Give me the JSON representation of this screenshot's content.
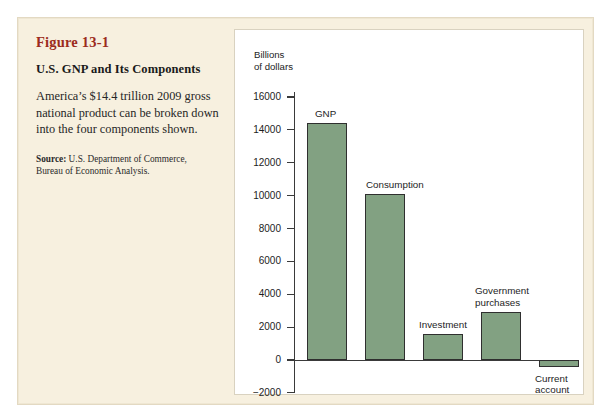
{
  "caption": {
    "figure_number": "Figure 13-1",
    "title": "U.S. GNP and Its Components",
    "description": "America’s $14.4 trillion 2009 gross national product can be broken down into the four components shown.",
    "source_label": "Source:",
    "source_text": " U.S. Department of Commerce, Bureau of Economic Analysis."
  },
  "colors": {
    "bar_fill": "#82a182",
    "bar_stroke": "#2f2f2f",
    "panel_background": "#f7f0df",
    "chart_background": "#ffffff",
    "figure_number_color": "#9c2b20",
    "axis_color": "#3a3a3a"
  },
  "chart_data": {
    "type": "bar",
    "title": "U.S. GNP and Its Components",
    "xlabel": "",
    "ylabel": "Billions\nof dollars",
    "categories": [
      "GNP",
      "Consumption",
      "Investment",
      "Government purchases",
      "Current account"
    ],
    "values": [
      14400,
      10100,
      1600,
      2900,
      -400
    ],
    "ylim": [
      -2000,
      16000
    ],
    "ytick_labels": [
      "16000",
      "14000",
      "12000",
      "10000",
      "8000",
      "6000",
      "4000",
      "2000",
      "0",
      "−2000"
    ],
    "ytick_values": [
      16000,
      14000,
      12000,
      10000,
      8000,
      6000,
      4000,
      2000,
      0,
      -2000
    ],
    "grid": false,
    "legend": "none",
    "bar_labels": [
      "GNP",
      "Consumption",
      "Investment",
      "Government\npurchases",
      "Current\naccount"
    ]
  }
}
